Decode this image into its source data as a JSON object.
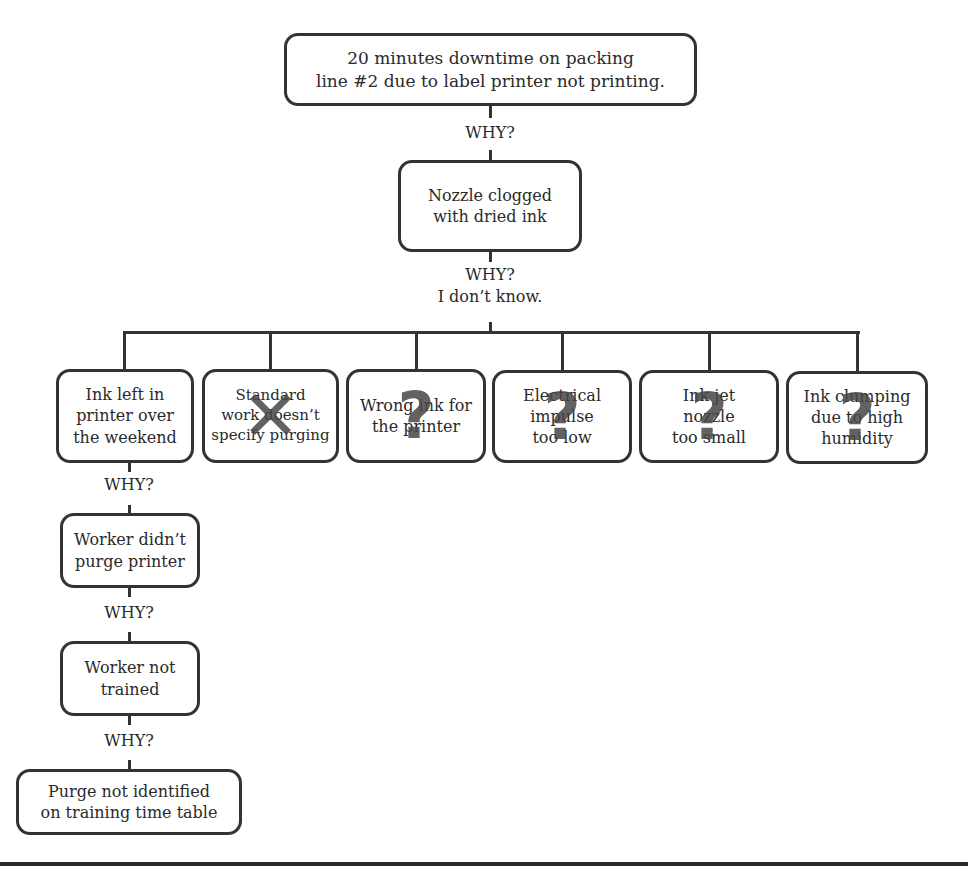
{
  "diagram": {
    "type": "5-whys root cause analysis",
    "problem": "20 minutes downtime on packing\nline #2 due to label printer not printing.",
    "why_1_label": "WHY?",
    "cause_1": "Nozzle clogged\nwith dried ink",
    "why_2_label": "WHY?\nI don’t know.",
    "candidates": [
      {
        "text": "Ink left in\nprinter over\nthe weekend",
        "mark": "",
        "mark_name": "none"
      },
      {
        "text": "Standard\nwork doesn’t\nspecify purging",
        "mark": "✕",
        "mark_name": "x-mark-icon"
      },
      {
        "text": "Wrong ink for\nthe printer",
        "mark": "?",
        "mark_name": "question-mark-icon"
      },
      {
        "text": "Electrical\nimpulse\ntoo low",
        "mark": "?",
        "mark_name": "question-mark-icon"
      },
      {
        "text": "Ink jet\nnozzle\ntoo small",
        "mark": "?",
        "mark_name": "question-mark-icon"
      },
      {
        "text": "Ink clumping\ndue to high\nhumidity",
        "mark": "?",
        "mark_name": "question-mark-icon"
      }
    ],
    "chain": [
      {
        "why": "WHY?",
        "cause": "Worker didn’t\npurge printer"
      },
      {
        "why": "WHY?",
        "cause": "Worker not\ntrained"
      },
      {
        "why": "WHY?",
        "cause": "Purge not identified\non training time table"
      }
    ],
    "colors": {
      "line": "#333333",
      "text": "#2a2a2a",
      "mark": "#464646"
    }
  }
}
